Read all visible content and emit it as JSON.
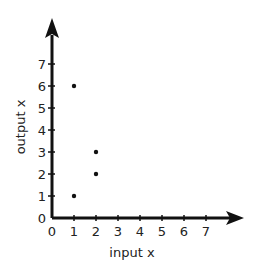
{
  "chart_data": {
    "type": "scatter",
    "title": "",
    "xlabel": "input x",
    "ylabel": "output x",
    "x_ticks": [
      "0",
      "1",
      "2",
      "3",
      "4",
      "5",
      "6",
      "7"
    ],
    "y_ticks": [
      "0",
      "1",
      "2",
      "3",
      "4",
      "5",
      "6",
      "7"
    ],
    "xlim": [
      0,
      8
    ],
    "ylim": [
      0,
      8
    ],
    "grid": false,
    "points": [
      {
        "x": 1,
        "y": 6
      },
      {
        "x": 1,
        "y": 1
      },
      {
        "x": 2,
        "y": 3
      },
      {
        "x": 2,
        "y": 2
      }
    ]
  }
}
